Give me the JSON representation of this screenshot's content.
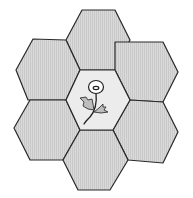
{
  "diagram": {
    "type": "hexagon-cluster",
    "hex_count": 7,
    "colors": {
      "background": "#ffffff",
      "outer_fill": "#d9d9d9",
      "stripe": "#c8c8c8",
      "center_fill": "#ececec",
      "stroke": "#2a2a2a"
    },
    "hexagons": [
      {
        "id": "top",
        "points": "82,10 115,10 130,40 115,70 80,70 66,40"
      },
      {
        "id": "upper-left",
        "points": "33,39 66,40 80,70 66,100 28,100 16,70"
      },
      {
        "id": "upper-right",
        "points": "115,42 163,42 178,72 163,102 130,100 115,70"
      },
      {
        "id": "lower-left",
        "points": "30,100 66,100 80,130 63,160 30,160 14,128"
      },
      {
        "id": "lower-right",
        "points": "130,100 163,102 178,132 163,163 128,160 113,130"
      },
      {
        "id": "bottom",
        "points": "80,130 113,130 128,160 110,190 78,190 63,160"
      },
      {
        "id": "center",
        "points": "80,70 115,70 130,100 113,130 80,130 66,100",
        "content": "flower"
      }
    ],
    "center_icon": "flower-icon"
  }
}
